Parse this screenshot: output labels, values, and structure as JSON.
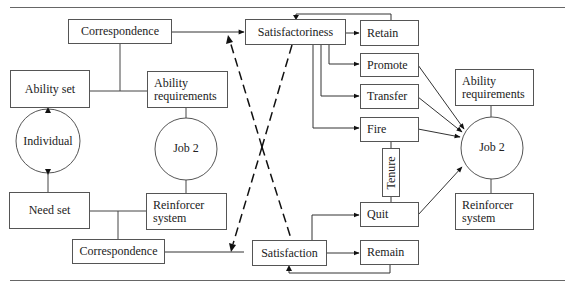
{
  "diagram": {
    "type": "flow-model",
    "left_panel": {
      "correspondence_top": "Correspondence",
      "ability_set": "Ability set",
      "ability_requirements": [
        "Ability",
        "requirements"
      ],
      "individual": "Individual",
      "job": "Job 2",
      "need_set": "Need set",
      "reinforcer_system": [
        "Reinforcer",
        "system"
      ],
      "correspondence_bottom": "Correspondence"
    },
    "middle": {
      "satisfactoriness": "Satisfactoriness",
      "satisfaction": "Satisfaction"
    },
    "outcomes": {
      "retain": "Retain",
      "promote": "Promote",
      "transfer": "Transfer",
      "fire": "Fire",
      "tenure": "Tenure",
      "quit": "Quit",
      "remain": "Remain"
    },
    "right_panel": {
      "ability_requirements": [
        "Ability",
        "requirements"
      ],
      "job": "Job 2",
      "reinforcer_system": [
        "Reinforcer",
        "system"
      ]
    },
    "colors": {
      "line": "#333333",
      "box_border": "#555555",
      "text": "#222222",
      "rule": "#666666"
    }
  }
}
